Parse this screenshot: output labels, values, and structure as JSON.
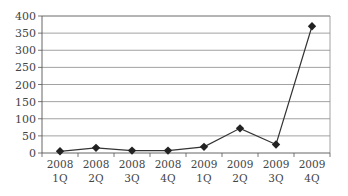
{
  "chart_data": {
    "type": "line",
    "title": "",
    "xlabel": "",
    "ylabel": "",
    "categories": [
      [
        "2008",
        "1Q"
      ],
      [
        "2008",
        "2Q"
      ],
      [
        "2008",
        "3Q"
      ],
      [
        "2008",
        "4Q"
      ],
      [
        "2009",
        "1Q"
      ],
      [
        "2009",
        "2Q"
      ],
      [
        "2009",
        "3Q"
      ],
      [
        "2009",
        "4Q"
      ]
    ],
    "series": [
      {
        "name": "Series 1",
        "values": [
          5,
          15,
          7,
          7,
          18,
          72,
          25,
          370
        ],
        "marker": "diamond",
        "color": "#222222"
      }
    ],
    "ylim": [
      0,
      400
    ],
    "yticks": [
      0,
      50,
      100,
      150,
      200,
      250,
      300,
      350,
      400
    ],
    "grid": true,
    "legend": "none"
  }
}
